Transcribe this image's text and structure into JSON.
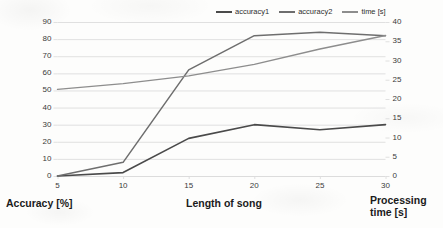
{
  "chart_data": {
    "type": "line",
    "title": "",
    "xlabel": "Length of song",
    "ylabel": "Accuracy [%]",
    "y2label": "Processing time [s]",
    "x": [
      5,
      10,
      15,
      20,
      25,
      30
    ],
    "xticklabels": [
      "5",
      "10",
      "15",
      "20",
      "25",
      "30"
    ],
    "xlim": [
      5,
      30
    ],
    "ylim": [
      0,
      90
    ],
    "yticks": [
      0,
      10,
      20,
      30,
      40,
      50,
      60,
      70,
      80,
      90
    ],
    "yticklabels": [
      "0",
      "10",
      "20",
      "30",
      "40",
      "50",
      "60",
      "70",
      "80",
      "90"
    ],
    "y2lim": [
      0,
      40
    ],
    "y2ticks": [
      0,
      5,
      10,
      15,
      20,
      25,
      30,
      35,
      40
    ],
    "y2ticklabels": [
      "0",
      "5",
      "10",
      "15",
      "20",
      "25",
      "30",
      "35",
      "40"
    ],
    "grid": true,
    "legend_position": "top",
    "series": [
      {
        "name": "accuracy1",
        "axis": "left",
        "color": "#4a4a4a",
        "width": 1.6,
        "values": [
          0,
          2,
          22,
          30,
          27,
          30
        ]
      },
      {
        "name": "accuracy2",
        "axis": "left",
        "color": "#6e6e6e",
        "width": 1.5,
        "values": [
          0,
          8,
          62,
          82,
          84,
          82
        ]
      },
      {
        "name": "time [s]",
        "axis": "right",
        "color": "#8d8d8d",
        "width": 1.4,
        "values": [
          22.5,
          24.0,
          26.0,
          29.0,
          33.0,
          36.5
        ]
      }
    ]
  },
  "axis_titles": {
    "left": "Accuracy [%]",
    "bottom": "Length of song",
    "right": "Processing\ntime [s]"
  },
  "colors": {
    "grid": "#dcdcdc",
    "text": "#3b3b3b",
    "title_text": "#1b1b1b",
    "background": "#fdfdfc"
  }
}
